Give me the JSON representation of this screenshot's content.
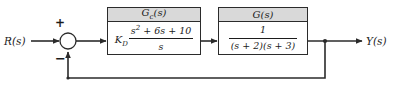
{
  "diagram": {
    "type": "control-system-block-diagram",
    "background_color": "#ffffff",
    "line_color": "#2b2b2b",
    "header_fill": "#d9d9d9"
  },
  "signals": {
    "input_label": "R(s)",
    "output_label": "Y(s)"
  },
  "summing_junction": {
    "name": "summing-junction",
    "plus_sign": "+",
    "minus_sign": "−",
    "center_x": 68,
    "center_y": 41,
    "radius": 8
  },
  "blocks": [
    {
      "id": "controller",
      "header": "G",
      "header_sub": "c",
      "header_suffix": "(s)",
      "gain": "K",
      "gain_sub": "D",
      "numerator": "s",
      "numerator_sup": "2",
      "numerator_rest": " + 6s + 10",
      "denominator": "s"
    },
    {
      "id": "plant",
      "header": "G",
      "header_sub": "",
      "header_suffix": "(s)",
      "gain": "",
      "gain_sub": "",
      "numerator": "1",
      "numerator_sup": "",
      "numerator_rest": "",
      "denominator": "(s + 2)(s + 3)"
    }
  ],
  "feedback": {
    "name": "unity-feedback-path",
    "gain": "1",
    "takeoff_x": 325,
    "bottom_y": 78
  }
}
